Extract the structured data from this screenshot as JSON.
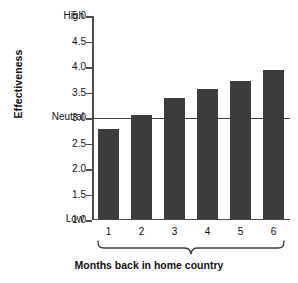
{
  "chart_data": {
    "type": "bar",
    "title": "",
    "xlabel": "Months back in home country",
    "ylabel": "Effectiveness",
    "categories": [
      "1",
      "2",
      "3",
      "4",
      "5",
      "6"
    ],
    "values": [
      2.78,
      3.05,
      3.4,
      3.57,
      3.73,
      3.95
    ],
    "ylim": [
      1.0,
      5.0
    ],
    "ytick_labels": [
      "5.0",
      "4.5",
      "4.0",
      "3.5",
      "3.0",
      "2.5",
      "2.0",
      "1.5",
      "1.0"
    ],
    "ytick_values": [
      5.0,
      4.5,
      4.0,
      3.5,
      3.0,
      2.5,
      2.0,
      1.5,
      1.0
    ],
    "scale_anchors": {
      "high": "High",
      "neutral": "Neutral",
      "low": "Low"
    },
    "reference_line": 3.0,
    "grid": false,
    "legend": "none",
    "bar_color": "#3c3c3c",
    "axis_color": "#4d4d4d"
  }
}
